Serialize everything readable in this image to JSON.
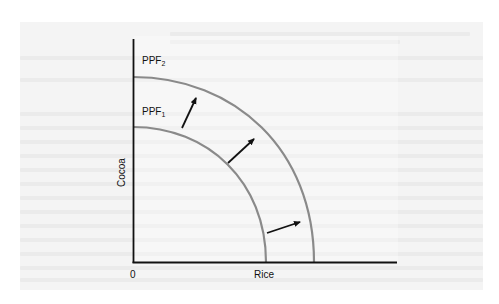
{
  "figure": {
    "type": "production-possibilities-frontier",
    "axes": {
      "y_label": "Cocoa",
      "x_label": "Rice",
      "origin_label": "0"
    },
    "curves": [
      {
        "id": "ppf1",
        "label_main": "PPF",
        "label_sub": "1",
        "color": "#8a8a8a"
      },
      {
        "id": "ppf2",
        "label_main": "PPF",
        "label_sub": "2",
        "color": "#8a8a8a"
      }
    ],
    "arrows": [
      {
        "direction": "outward",
        "note": "shift from PPF1 to PPF2"
      },
      {
        "direction": "outward",
        "note": "shift from PPF1 to PPF2"
      },
      {
        "direction": "outward",
        "note": "shift from PPF1 to PPF2"
      }
    ],
    "colors": {
      "axis": "#111111",
      "curve": "#8a8a8a",
      "arrow": "#111111",
      "panel": "#f4f4f4"
    }
  }
}
